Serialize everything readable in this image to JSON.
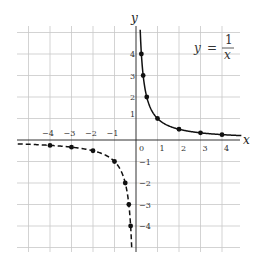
{
  "chart_data": {
    "type": "line",
    "title": "",
    "equation": {
      "lhs": "y",
      "equals": "=",
      "numerator": "1",
      "denominator": "x"
    },
    "xlabel": "x",
    "ylabel": "y",
    "xlim": [
      -5.5,
      5
    ],
    "ylim": [
      -5.3,
      5.3
    ],
    "grid": true,
    "x_ticks": [
      {
        "value": -4,
        "label": "−4"
      },
      {
        "value": -3,
        "label": "−3"
      },
      {
        "value": -2,
        "label": "−2"
      },
      {
        "value": -1,
        "label": "−1"
      },
      {
        "value": 0,
        "label": "0"
      },
      {
        "value": 1,
        "label": "1"
      },
      {
        "value": 2,
        "label": "2"
      },
      {
        "value": 3,
        "label": "3"
      },
      {
        "value": 4,
        "label": "4"
      }
    ],
    "y_ticks": [
      {
        "value": 4,
        "label": "4"
      },
      {
        "value": 3,
        "label": "3"
      },
      {
        "value": 2,
        "label": "2"
      },
      {
        "value": 1,
        "label": "1"
      },
      {
        "value": -1,
        "label": "−1"
      },
      {
        "value": -2,
        "label": "−2"
      },
      {
        "value": -3,
        "label": "−3"
      },
      {
        "value": -4,
        "label": "−4"
      }
    ],
    "series": [
      {
        "name": "y = 1/x (x > 0)",
        "style": "solid",
        "points": [
          [
            0.25,
            4
          ],
          [
            0.333,
            3
          ],
          [
            0.5,
            2
          ],
          [
            1,
            1
          ],
          [
            2,
            0.5
          ],
          [
            3,
            0.333
          ],
          [
            4,
            0.25
          ]
        ]
      },
      {
        "name": "y = 1/x (x < 0)",
        "style": "dashed",
        "points": [
          [
            -4,
            -0.25
          ],
          [
            -3,
            -0.333
          ],
          [
            -2,
            -0.5
          ],
          [
            -1,
            -1
          ],
          [
            -0.5,
            -2
          ],
          [
            -0.333,
            -3
          ],
          [
            -0.25,
            -4
          ]
        ]
      }
    ]
  }
}
